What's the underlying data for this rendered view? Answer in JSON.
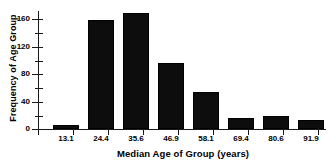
{
  "chart_data": {
    "type": "bar",
    "title": "",
    "xlabel": "Median Age of Group (years)",
    "ylabel": "Frequency of Age Group",
    "categories": [
      "13.1",
      "24.4",
      "35.6",
      "46.9",
      "58.1",
      "69.4",
      "80.6",
      "91.9"
    ],
    "values": [
      5,
      159,
      169,
      96,
      54,
      15,
      19,
      13
    ],
    "ylim": [
      0,
      172
    ],
    "ytick_major": [
      0,
      40,
      80,
      120,
      160
    ],
    "ytick_minor": [
      20,
      60,
      100,
      140
    ],
    "xlim_label_start": "13.1",
    "xlim_label_end": "91.9",
    "grid": false,
    "legend": "none",
    "bar_color": "#0d0d0d",
    "axis_color": "#1a1a1a",
    "background": "#ffffff"
  }
}
